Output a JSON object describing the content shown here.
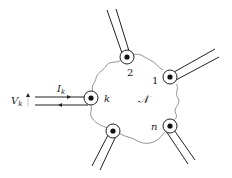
{
  "diagram": {
    "type": "multiport-network",
    "network_label": "𝒩",
    "ports": [
      {
        "id": "2",
        "label": "2"
      },
      {
        "id": "1",
        "label": "1"
      },
      {
        "id": "k",
        "label": "k"
      },
      {
        "id": "unlabeled",
        "label": ""
      },
      {
        "id": "n",
        "label": "n"
      }
    ],
    "port_k": {
      "current_label": "I",
      "current_sub": "k",
      "voltage_label": "V",
      "voltage_sub": "k"
    },
    "colors": {
      "line": "#222222",
      "boundary": "#777777",
      "background": "#ffffff"
    }
  }
}
